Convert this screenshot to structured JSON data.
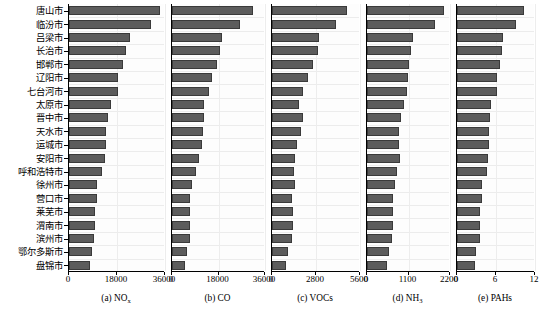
{
  "figure": {
    "cities": [
      "唐山市",
      "临汾市",
      "吕梁市",
      "长治市",
      "邯郸市",
      "辽阳市",
      "七台河市",
      "太原市",
      "晋中市",
      "天水市",
      "运城市",
      "安阳市",
      "呼和浩特市",
      "徐州市",
      "营口市",
      "莱芜市",
      "渭南市",
      "滨州市",
      "鄂尔多斯市",
      "盘锦市"
    ],
    "bar_color": "#5c5c5c",
    "bar_edge_color": "#3a3a3a",
    "grid_color": "#ececec",
    "axis_color": "#000000"
  },
  "chart_data": [
    {
      "type": "bar",
      "orientation": "horizontal",
      "panel_id": "a",
      "caption": "(a) NO",
      "caption_sub": "x",
      "title": "",
      "xlabel": "",
      "ylabel": "",
      "xlim": [
        0,
        36000
      ],
      "xticks": [
        0,
        18000,
        36000
      ],
      "xticklabels": [
        "0",
        "18000",
        "36000"
      ],
      "grid": true,
      "categories": [
        "唐山市",
        "临汾市",
        "吕梁市",
        "长治市",
        "邯郸市",
        "辽阳市",
        "七台河市",
        "太原市",
        "晋中市",
        "天水市",
        "运城市",
        "安阳市",
        "呼和浩特市",
        "徐州市",
        "营口市",
        "莱芜市",
        "渭南市",
        "滨州市",
        "鄂尔多斯市",
        "盘锦市"
      ],
      "values": [
        34100,
        30600,
        22700,
        21400,
        20200,
        18500,
        18300,
        15700,
        14800,
        13800,
        13800,
        13600,
        12400,
        10600,
        10600,
        9900,
        9900,
        9200,
        8800,
        8000
      ]
    },
    {
      "type": "bar",
      "orientation": "horizontal",
      "panel_id": "b",
      "caption": "(b) CO",
      "caption_sub": "",
      "title": "",
      "xlabel": "",
      "ylabel": "",
      "xlim": [
        0,
        36000
      ],
      "xticks": [
        0,
        18000,
        36000
      ],
      "xticklabels": [
        "0",
        "18000",
        "36000"
      ],
      "grid": true,
      "categories": [
        "唐山市",
        "临汾市",
        "吕梁市",
        "长治市",
        "邯郸市",
        "辽阳市",
        "七台河市",
        "太原市",
        "晋中市",
        "天水市",
        "运城市",
        "安阳市",
        "呼和浩特市",
        "徐州市",
        "营口市",
        "莱芜市",
        "渭南市",
        "滨州市",
        "鄂尔多斯市",
        "盘锦市"
      ],
      "values": [
        31200,
        26500,
        19300,
        18500,
        17500,
        15500,
        14400,
        12300,
        12300,
        11900,
        11500,
        10300,
        9300,
        7600,
        7000,
        7100,
        7000,
        6900,
        5800,
        5000
      ]
    },
    {
      "type": "bar",
      "orientation": "horizontal",
      "panel_id": "c",
      "caption": "(c) VOCs",
      "caption_sub": "",
      "title": "",
      "xlabel": "",
      "ylabel": "",
      "xlim": [
        0,
        5600
      ],
      "xticks": [
        0,
        2800,
        5600
      ],
      "xticklabels": [
        "0",
        "2800",
        "5600"
      ],
      "grid": true,
      "categories": [
        "唐山市",
        "临汾市",
        "吕梁市",
        "长治市",
        "邯郸市",
        "辽阳市",
        "七台河市",
        "太原市",
        "晋中市",
        "天水市",
        "运城市",
        "安阳市",
        "呼和浩特市",
        "徐州市",
        "营口市",
        "莱芜市",
        "渭南市",
        "滨州市",
        "鄂尔多斯市",
        "盘锦市"
      ],
      "values": [
        4750,
        4050,
        3000,
        2950,
        2600,
        2300,
        1950,
        1700,
        2000,
        1850,
        1600,
        1450,
        1400,
        1450,
        1300,
        1350,
        1350,
        1300,
        1000,
        900
      ]
    },
    {
      "type": "bar",
      "orientation": "horizontal",
      "panel_id": "d",
      "caption": "(d) NH",
      "caption_sub": "3",
      "title": "",
      "xlabel": "",
      "ylabel": "",
      "xlim": [
        0,
        2200
      ],
      "xticks": [
        0,
        1100,
        2200
      ],
      "xticklabels": [
        "0",
        "1100",
        "2200"
      ],
      "grid": true,
      "categories": [
        "唐山市",
        "临汾市",
        "吕梁市",
        "长治市",
        "邯郸市",
        "辽阳市",
        "七台河市",
        "太原市",
        "晋中市",
        "天水市",
        "运城市",
        "安阳市",
        "呼和浩特市",
        "徐州市",
        "营口市",
        "莱芜市",
        "渭南市",
        "滨州市",
        "鄂尔多斯市",
        "盘锦市"
      ],
      "values": [
        2050,
        1800,
        1220,
        1160,
        1120,
        1080,
        1060,
        970,
        900,
        860,
        850,
        880,
        800,
        730,
        680,
        690,
        680,
        650,
        580,
        540
      ]
    },
    {
      "type": "bar",
      "orientation": "horizontal",
      "panel_id": "e",
      "caption": "(e) PAHs",
      "caption_sub": "",
      "title": "",
      "xlabel": "",
      "ylabel": "",
      "xlim": [
        0,
        12
      ],
      "xticks": [
        0,
        6,
        12
      ],
      "xticklabels": [
        "0",
        "6",
        "12"
      ],
      "grid": true,
      "categories": [
        "唐山市",
        "临汾市",
        "吕梁市",
        "长治市",
        "邯郸市",
        "辽阳市",
        "七台河市",
        "太原市",
        "晋中市",
        "天水市",
        "运城市",
        "安阳市",
        "呼和浩特市",
        "徐州市",
        "营口市",
        "莱芜市",
        "渭南市",
        "滨州市",
        "鄂尔多斯市",
        "盘锦市"
      ],
      "values": [
        10.3,
        9.1,
        7.1,
        6.9,
        6.6,
        6.2,
        6.2,
        5.2,
        5.1,
        4.9,
        4.9,
        4.7,
        4.6,
        3.9,
        3.8,
        3.5,
        3.6,
        3.5,
        2.9,
        2.8
      ]
    }
  ]
}
